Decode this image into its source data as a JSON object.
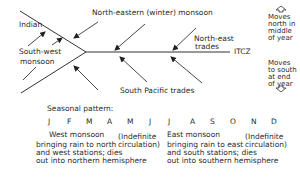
{
  "diagram": {
    "labels": {
      "indian": "Indian",
      "south_west_monsoon_line1": "South-west",
      "south_west_monsoon_line2": "monsoon",
      "north_eastern_monsoon": "North-eastern (winter) monsoon",
      "north_east_trades_line1": "North-east",
      "north_east_trades_line2": "trades",
      "itcz": "ITCZ",
      "south_pacific_trades": "South Pacific trades",
      "moves_north": [
        "Moves",
        "north in",
        "middle",
        "of year"
      ],
      "moves_south": [
        "Moves",
        "to south",
        "at end",
        "of year"
      ]
    },
    "icons": {
      "up_marker": "up-arrow-outline-icon",
      "down_marker": "down-arrow-outline-icon"
    }
  },
  "seasonal": {
    "title": "Seasonal pattern:",
    "months": [
      "J",
      "F",
      "M",
      "A",
      "M",
      "J",
      "J",
      "A",
      "S",
      "O",
      "N",
      "D"
    ],
    "west_monsoon": {
      "heading": "West monsoon",
      "lines": [
        "bringing rain to north",
        "and west stations; dies",
        "out into northern hemisphere"
      ]
    },
    "indefinite_1": [
      "(Indefinite",
      "circulation)"
    ],
    "east_monsoon": {
      "heading": "East monsoon",
      "lines": [
        "bringing rain to east",
        "and south stations; dies",
        "out into southern hemisphere"
      ]
    },
    "indefinite_2": [
      "(Indefinite",
      "circulation)"
    ]
  }
}
